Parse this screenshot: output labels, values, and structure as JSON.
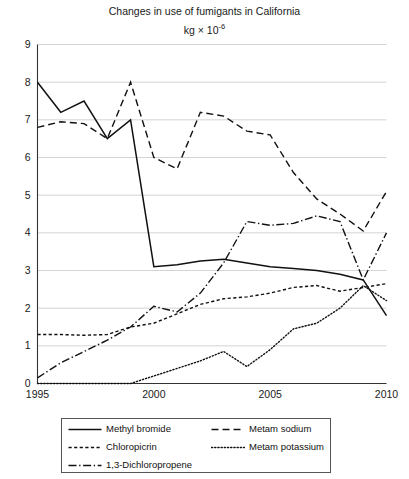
{
  "chart_data": {
    "type": "line",
    "title": "Changes in use of fumigants in California",
    "subtitle_prefix": "kg × 10",
    "subtitle_exponent": "-6",
    "xlabel": "",
    "ylabel": "",
    "xlim": [
      1995,
      2010
    ],
    "ylim": [
      0,
      9
    ],
    "grid": true,
    "grid_axis": "y",
    "legend_position": "below-center",
    "x_tick_labels": [
      "1995",
      "2000",
      "2005",
      "2010"
    ],
    "x_tick_values": [
      1995,
      2000,
      2005,
      2010
    ],
    "y_tick_labels": [
      "0",
      "1",
      "2",
      "3",
      "4",
      "5",
      "6",
      "7",
      "8",
      "9"
    ],
    "y_tick_values": [
      0,
      1,
      2,
      3,
      4,
      5,
      6,
      7,
      8,
      9
    ],
    "x": [
      1995,
      1996,
      1997,
      1998,
      1999,
      2000,
      2001,
      2002,
      2003,
      2004,
      2005,
      2006,
      2007,
      2008,
      2009,
      2010
    ],
    "series": [
      {
        "name": "Methyl bromide",
        "dash_style": "solid",
        "color": "#111111",
        "values": [
          8.0,
          7.2,
          7.5,
          6.5,
          7.0,
          3.1,
          3.15,
          3.25,
          3.3,
          3.2,
          3.1,
          3.05,
          3.0,
          2.9,
          2.75,
          1.8
        ]
      },
      {
        "name": "Metam sodium",
        "dash_style": "dashed",
        "color": "#111111",
        "values": [
          6.8,
          6.95,
          6.9,
          6.5,
          8.0,
          6.0,
          5.7,
          7.2,
          7.1,
          6.7,
          6.6,
          5.6,
          4.9,
          4.5,
          4.05,
          5.1
        ]
      },
      {
        "name": "Chloropicrin",
        "dash_style": "short-dash",
        "color": "#111111",
        "values": [
          1.3,
          1.3,
          1.28,
          1.3,
          1.5,
          1.6,
          1.85,
          2.1,
          2.25,
          2.3,
          2.4,
          2.55,
          2.6,
          2.45,
          2.55,
          2.65
        ]
      },
      {
        "name": "Metam potassium",
        "dash_style": "dotted",
        "color": "#111111",
        "values": [
          0.0,
          0.0,
          0.0,
          0.0,
          0.0,
          0.2,
          0.4,
          0.6,
          0.85,
          0.45,
          0.9,
          1.45,
          1.6,
          2.0,
          2.6,
          2.2
        ]
      },
      {
        "name": "1,3-Dichloropropene",
        "dash_style": "dash-dot",
        "color": "#111111",
        "values": [
          0.15,
          0.55,
          0.85,
          1.15,
          1.5,
          2.05,
          1.9,
          2.4,
          3.2,
          4.3,
          4.2,
          4.25,
          4.45,
          4.3,
          2.75,
          4.0
        ]
      }
    ]
  },
  "legend": {
    "entries": [
      {
        "label": "Methyl bromide",
        "key": "solid-line-key"
      },
      {
        "label": "Metam sodium",
        "key": "dashed-line-key"
      },
      {
        "label": "Chloropicrin",
        "key": "short-dash-line-key"
      },
      {
        "label": "Metam potassium",
        "key": "dotted-line-key"
      },
      {
        "label": "1,3-Dichloropropene",
        "key": "dash-dot-line-key"
      }
    ]
  }
}
